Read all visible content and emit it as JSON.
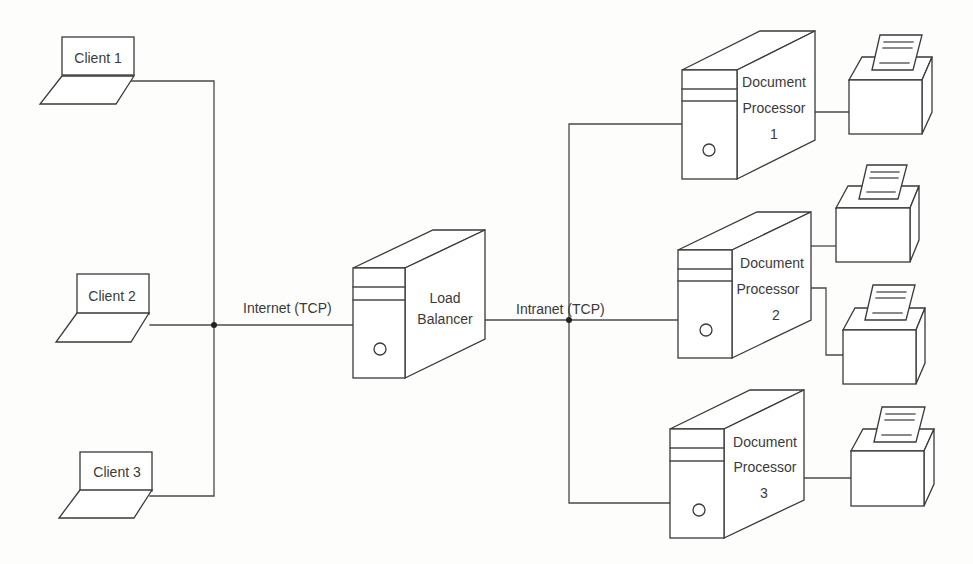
{
  "diagram": {
    "type": "network-architecture",
    "clients": [
      {
        "label": "Client 1"
      },
      {
        "label": "Client 2"
      },
      {
        "label": "Client 3"
      }
    ],
    "load_balancer": {
      "line1": "Load",
      "line2": "Balancer"
    },
    "networks": {
      "internet": "Internet (TCP)",
      "intranet": "Intranet (TCP)"
    },
    "processors": [
      {
        "line1": "Document",
        "line2": "Processor",
        "line3": "1",
        "printers": 1
      },
      {
        "line1": "Document",
        "line2": "Processor",
        "line3": "2",
        "printers": 2
      },
      {
        "line1": "Document",
        "line2": "Processor",
        "line3": "3",
        "printers": 1
      }
    ],
    "printers": [
      {
        "name": "printer-1",
        "attached_to": "Document Processor 1"
      },
      {
        "name": "printer-2a",
        "attached_to": "Document Processor 2"
      },
      {
        "name": "printer-2b",
        "attached_to": "Document Processor 2"
      },
      {
        "name": "printer-3",
        "attached_to": "Document Processor 3"
      }
    ],
    "colors": {
      "stroke": "#3a3a3a",
      "background": "#fdfdfc",
      "text": "#3a3a3a"
    }
  }
}
